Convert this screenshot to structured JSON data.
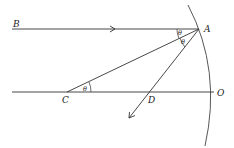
{
  "diagram": {
    "labels": {
      "B": "B",
      "A": "A",
      "C": "C",
      "D": "D",
      "O": "O",
      "theta_top": "θ",
      "theta_mid": "θ",
      "theta_c": "θ"
    },
    "colors": {
      "line": "#333333",
      "background": "#ffffff"
    }
  }
}
